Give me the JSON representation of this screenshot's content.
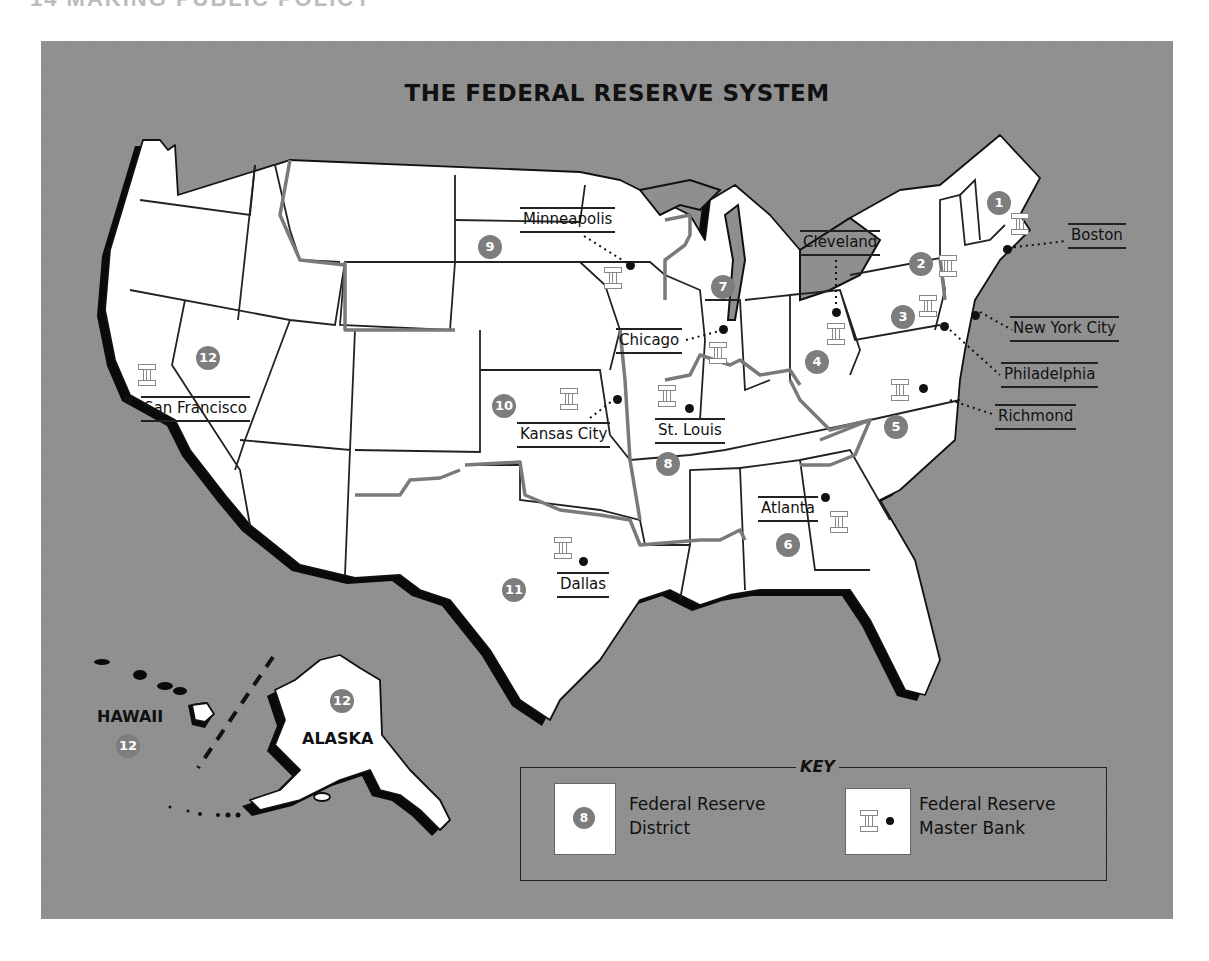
{
  "page_header": "14   MAKING PUBLIC POLICY",
  "map": {
    "title": "THE FEDERAL RESERVE SYSTEM",
    "colors": {
      "background": "#8f8f8f",
      "land": "#ffffff",
      "district_circle": "#7d7d7d",
      "district_border": "#7a7a7a"
    },
    "districts": [
      {
        "number": "1",
        "x": 946,
        "y": 150
      },
      {
        "number": "2",
        "x": 868,
        "y": 211
      },
      {
        "number": "3",
        "x": 850,
        "y": 264
      },
      {
        "number": "4",
        "x": 764,
        "y": 309
      },
      {
        "number": "5",
        "x": 843,
        "y": 374
      },
      {
        "number": "6",
        "x": 735,
        "y": 492
      },
      {
        "number": "7",
        "x": 670,
        "y": 234
      },
      {
        "number": "8",
        "x": 615,
        "y": 411
      },
      {
        "number": "9",
        "x": 437,
        "y": 194
      },
      {
        "number": "10",
        "x": 451,
        "y": 353
      },
      {
        "number": "11",
        "x": 461,
        "y": 577
      },
      {
        "number": "12",
        "x": 155,
        "y": 305
      }
    ],
    "cities": [
      {
        "name": "Boston",
        "label_x": 1008,
        "label_y": 184
      },
      {
        "name": "New York City",
        "label_x": 1010,
        "label_y": 316
      },
      {
        "name": "Philadelphia",
        "label_x": 1001,
        "label_y": 362
      },
      {
        "name": "Richmond",
        "label_x": 995,
        "label_y": 404
      },
      {
        "name": "Cleveland",
        "label_x": 800,
        "label_y": 230
      },
      {
        "name": "Chicago",
        "label_x": 617,
        "label_y": 328
      },
      {
        "name": "Minneapolis",
        "label_x": 520,
        "label_y": 208
      },
      {
        "name": "Kansas City",
        "label_x": 517,
        "label_y": 423
      },
      {
        "name": "St. Louis",
        "label_x": 655,
        "label_y": 420
      },
      {
        "name": "Atlanta",
        "label_x": 758,
        "label_y": 497
      },
      {
        "name": "Dallas",
        "label_x": 557,
        "label_y": 573
      },
      {
        "name": "San Francisco",
        "label_x": 141,
        "label_y": 398
      }
    ],
    "regions": {
      "hawaii": {
        "label": "HAWAII",
        "district": "12"
      },
      "alaska": {
        "label": "ALASKA",
        "district": "12"
      }
    }
  },
  "key": {
    "title": "KEY",
    "items": [
      {
        "symbol": "8",
        "label_line1": "Federal Reserve",
        "label_line2": "District"
      },
      {
        "symbol": "bank-column-icon",
        "label_line1": "Federal Reserve",
        "label_line2": "Master Bank"
      }
    ]
  }
}
